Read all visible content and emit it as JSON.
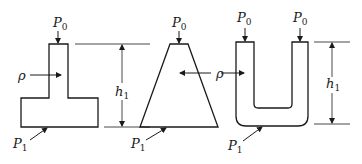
{
  "figure": {
    "shapes": [
      {
        "name": "inverted-t-vessel",
        "labels": {
          "top_pressure": "P",
          "top_sub": "0",
          "density": "ρ",
          "height": "h",
          "height_sub": "1",
          "bottom_pressure": "P",
          "bottom_sub": "1"
        }
      },
      {
        "name": "trapezoid-vessel",
        "labels": {
          "top_pressure": "P",
          "top_sub": "0",
          "density": "ρ",
          "bottom_pressure": "P",
          "bottom_sub": "1"
        }
      },
      {
        "name": "u-tube-vessel",
        "labels": {
          "left_top_pressure": "P",
          "left_top_sub": "0",
          "right_top_pressure": "P",
          "right_top_sub": "0",
          "height": "h",
          "height_sub": "1",
          "bottom_pressure": "P",
          "bottom_sub": "1"
        }
      }
    ],
    "colors": {
      "ink": "#1a1a1a",
      "background": "#ffffff"
    }
  }
}
